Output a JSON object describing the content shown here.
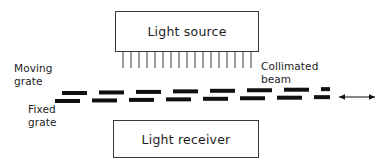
{
  "figure": {
    "type": "optical-encoder-schematic",
    "background_color": "#ffffff",
    "line_color": "#3a3a3a",
    "mark_color": "#111111"
  },
  "blocks": {
    "light_source": {
      "label": "Light source",
      "x": 115,
      "y": 11,
      "width": 144,
      "height": 41
    },
    "light_receiver": {
      "label": "Light receiver",
      "x": 113,
      "y": 120,
      "width": 146,
      "height": 38
    }
  },
  "collimator": {
    "name": "collimator-comb",
    "line_count": 17,
    "x": 115,
    "y": 51,
    "width": 144,
    "height": 18
  },
  "labels": {
    "moving_grate": "Moving\ngrate",
    "fixed_grate": "Fixed\ngrate",
    "collimated_beam": "Collimated\nbeam"
  },
  "grates": {
    "moving": {
      "name": "moving-grate",
      "dash_count": 8,
      "row_y": 8,
      "start_x": 7,
      "pitch": 37,
      "dash_width": 25,
      "dash_height": 4
    },
    "fixed": {
      "name": "fixed-grate",
      "dash_count": 8,
      "row_y": 16,
      "start_x": 0,
      "pitch": 37,
      "dash_width": 25,
      "dash_height": 4
    },
    "skew_per_dash": -0.55
  },
  "motion_arrow": {
    "name": "motion-arrow",
    "kind": "double-headed-horizontal",
    "x": 334,
    "y": 88,
    "width": 46,
    "height": 18
  }
}
